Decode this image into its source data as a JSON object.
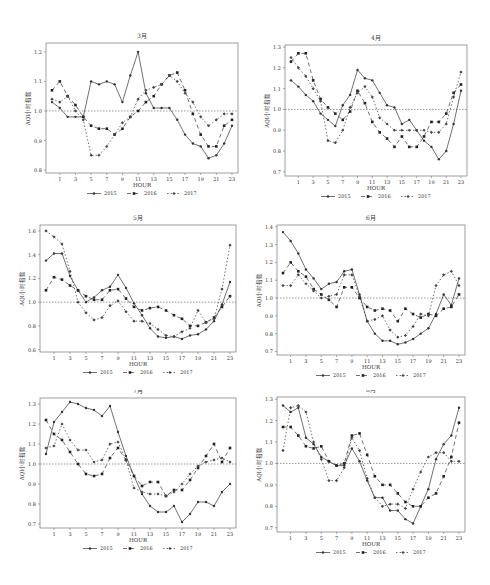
{
  "figure": {
    "note": "Series values are approximate visual estimates read from the plotted points, not printed data labels.",
    "legend": [
      "2015",
      "2016",
      "2017"
    ],
    "xlabel": "HOUR",
    "ylabel": "AQI小时指数",
    "reference_line": 1.0
  },
  "chart_data": [
    {
      "type": "line",
      "title": "3月",
      "xlabel": "HOUR",
      "ylabel": "AQI小时指数",
      "x": [
        0,
        1,
        2,
        3,
        4,
        5,
        6,
        7,
        8,
        9,
        10,
        11,
        12,
        13,
        14,
        15,
        16,
        17,
        18,
        19,
        20,
        21,
        22,
        23
      ],
      "xticks": [
        "1",
        "3",
        "5",
        "7",
        "9",
        "11",
        "13",
        "15",
        "17",
        "19",
        "21",
        "23"
      ],
      "yticks": [
        "0.8",
        "0.9",
        "1.0",
        "1.1",
        "1.2"
      ],
      "ylim": [
        0.79,
        1.23
      ],
      "series": [
        {
          "name": "2015",
          "values": [
            1.03,
            1.01,
            0.98,
            0.98,
            0.98,
            1.1,
            1.09,
            1.1,
            1.09,
            1.03,
            1.12,
            1.2,
            1.06,
            1.01,
            1.01,
            1.01,
            0.97,
            0.92,
            0.89,
            0.88,
            0.84,
            0.85,
            0.89,
            0.95
          ]
        },
        {
          "name": "2016",
          "values": [
            1.07,
            1.1,
            1.05,
            1.02,
            0.98,
            0.95,
            0.94,
            0.94,
            0.92,
            0.94,
            0.98,
            1.0,
            1.03,
            1.05,
            1.09,
            1.12,
            1.13,
            1.07,
            0.99,
            0.92,
            0.88,
            0.88,
            0.95,
            0.97
          ]
        },
        {
          "name": "2017",
          "values": [
            1.04,
            1.03,
            1.05,
            1.0,
            0.97,
            0.85,
            0.85,
            0.88,
            0.92,
            0.96,
            0.98,
            1.04,
            1.07,
            1.08,
            1.09,
            1.12,
            1.1,
            1.06,
            1.03,
            0.98,
            0.95,
            0.97,
            0.99,
            0.99
          ]
        }
      ]
    },
    {
      "type": "line",
      "title": "4月",
      "xlabel": "HOUR",
      "ylabel": "AQI小时指数",
      "x": [
        0,
        1,
        2,
        3,
        4,
        5,
        6,
        7,
        8,
        9,
        10,
        11,
        12,
        13,
        14,
        15,
        16,
        17,
        18,
        19,
        20,
        21,
        22,
        23
      ],
      "xticks": [
        "1",
        "3",
        "5",
        "7",
        "9",
        "11",
        "13",
        "15",
        "17",
        "19",
        "21",
        "23"
      ],
      "yticks": [
        "0.7",
        "0.8",
        "0.9",
        "1.0",
        "1.1",
        "1.2",
        "1.3"
      ],
      "ylim": [
        0.68,
        1.31
      ],
      "series": [
        {
          "name": "2015",
          "values": [
            1.14,
            1.11,
            1.07,
            1.04,
            0.98,
            0.95,
            0.92,
            1.02,
            1.07,
            1.19,
            1.15,
            1.14,
            1.08,
            1.02,
            1.01,
            0.93,
            0.95,
            0.9,
            0.85,
            0.82,
            0.76,
            0.8,
            0.93,
            1.09
          ]
        },
        {
          "name": "2016",
          "values": [
            1.23,
            1.27,
            1.27,
            1.14,
            1.05,
            1.01,
            0.98,
            0.95,
            0.99,
            1.09,
            1.03,
            0.94,
            0.89,
            0.86,
            0.82,
            0.87,
            0.82,
            0.82,
            0.87,
            0.94,
            0.94,
            0.98,
            1.08,
            1.12
          ]
        },
        {
          "name": "2017",
          "values": [
            1.25,
            1.2,
            1.16,
            1.1,
            1.04,
            0.85,
            0.84,
            0.9,
            1.01,
            1.08,
            1.11,
            1.06,
            0.96,
            0.93,
            0.9,
            0.9,
            0.9,
            0.9,
            0.9,
            0.89,
            0.89,
            0.93,
            1.06,
            1.18
          ]
        }
      ]
    },
    {
      "type": "line",
      "title": "5月",
      "xlabel": "HOUR",
      "ylabel": "AQI小时指数",
      "x": [
        0,
        1,
        2,
        3,
        4,
        5,
        6,
        7,
        8,
        9,
        10,
        11,
        12,
        13,
        14,
        15,
        16,
        17,
        18,
        19,
        20,
        21,
        22,
        23
      ],
      "xticks": [
        "1",
        "3",
        "5",
        "7",
        "9",
        "11",
        "13",
        "15",
        "17",
        "19",
        "21",
        "23"
      ],
      "yticks": [
        "0.6",
        "0.8",
        "1.0",
        "1.2",
        "1.4",
        "1.6"
      ],
      "ylim": [
        0.58,
        1.65
      ],
      "series": [
        {
          "name": "2015",
          "values": [
            1.35,
            1.41,
            1.41,
            1.22,
            1.1,
            1.0,
            1.04,
            1.1,
            1.13,
            1.23,
            1.12,
            0.99,
            0.89,
            0.78,
            0.71,
            0.7,
            0.71,
            0.69,
            0.72,
            0.73,
            0.77,
            0.84,
            0.98,
            1.17
          ]
        },
        {
          "name": "2016",
          "values": [
            1.1,
            1.21,
            1.19,
            1.14,
            1.1,
            1.05,
            1.02,
            1.02,
            1.1,
            1.11,
            1.03,
            0.96,
            0.93,
            0.95,
            0.96,
            0.93,
            0.89,
            0.86,
            0.8,
            0.8,
            0.83,
            0.87,
            0.96,
            1.05
          ]
        },
        {
          "name": "2017",
          "values": [
            1.6,
            1.55,
            1.49,
            1.26,
            1.0,
            0.91,
            0.85,
            0.87,
            0.97,
            1.01,
            0.92,
            0.84,
            0.84,
            0.82,
            0.77,
            0.72,
            0.71,
            0.75,
            0.78,
            0.93,
            0.83,
            0.86,
            1.11,
            1.48
          ]
        }
      ]
    },
    {
      "type": "line",
      "title": "6月",
      "xlabel": "HOUR",
      "ylabel": "AQI小时指数",
      "x": [
        0,
        1,
        2,
        3,
        4,
        5,
        6,
        7,
        8,
        9,
        10,
        11,
        12,
        13,
        14,
        15,
        16,
        17,
        18,
        19,
        20,
        21,
        22,
        23
      ],
      "xticks": [
        "1",
        "3",
        "5",
        "7",
        "9",
        "11",
        "13",
        "15",
        "17",
        "19",
        "21",
        "23"
      ],
      "yticks": [
        "0.7",
        "0.8",
        "0.9",
        "1.0",
        "1.1",
        "1.2",
        "1.3",
        "1.4"
      ],
      "ylim": [
        0.68,
        1.41
      ],
      "series": [
        {
          "name": "2015",
          "values": [
            1.37,
            1.32,
            1.25,
            1.16,
            1.11,
            1.05,
            1.08,
            1.09,
            1.15,
            1.16,
            1.02,
            0.87,
            0.8,
            0.76,
            0.76,
            0.74,
            0.75,
            0.77,
            0.8,
            0.83,
            0.91,
            1.02,
            0.96,
            1.11
          ]
        },
        {
          "name": "2016",
          "values": [
            1.14,
            1.2,
            1.15,
            1.12,
            1.05,
            1.02,
            0.99,
            0.95,
            1.06,
            1.06,
            1.0,
            0.95,
            0.93,
            0.94,
            0.93,
            0.87,
            0.94,
            0.91,
            0.89,
            0.91,
            0.9,
            0.94,
            0.95,
            1.02
          ]
        },
        {
          "name": "2017",
          "values": [
            1.07,
            1.07,
            1.13,
            1.08,
            1.04,
            1.0,
            1.01,
            1.02,
            1.13,
            1.13,
            1.01,
            0.87,
            0.88,
            0.9,
            0.82,
            0.78,
            0.79,
            0.84,
            0.91,
            0.9,
            1.07,
            1.13,
            1.15,
            1.07
          ]
        }
      ]
    },
    {
      "type": "line",
      "title": "7月",
      "xlabel": "HOUR",
      "ylabel": "AQI小时指数",
      "x": [
        0,
        1,
        2,
        3,
        4,
        5,
        6,
        7,
        8,
        9,
        10,
        11,
        12,
        13,
        14,
        15,
        16,
        17,
        18,
        19,
        20,
        21,
        22,
        23
      ],
      "xticks": [
        "1",
        "3",
        "5",
        "7",
        "9",
        "11",
        "13",
        "15",
        "17",
        "19",
        "21",
        "23"
      ],
      "yticks": [
        "0.7",
        "0.8",
        "0.9",
        "1.0",
        "1.1",
        "1.2",
        "1.3"
      ],
      "ylim": [
        0.68,
        1.33
      ],
      "series": [
        {
          "name": "2015",
          "values": [
            1.05,
            1.21,
            1.26,
            1.31,
            1.3,
            1.28,
            1.27,
            1.24,
            1.29,
            1.16,
            1.04,
            0.94,
            0.85,
            0.79,
            0.76,
            0.76,
            0.79,
            0.71,
            0.75,
            0.81,
            0.81,
            0.79,
            0.86,
            0.9
          ]
        },
        {
          "name": "2016",
          "values": [
            1.22,
            1.15,
            1.12,
            1.06,
            1.0,
            0.95,
            0.94,
            0.95,
            1.03,
            1.08,
            1.02,
            0.94,
            0.89,
            0.91,
            0.91,
            0.84,
            0.87,
            0.87,
            0.92,
            0.98,
            1.04,
            1.1,
            1.01,
            1.08
          ]
        },
        {
          "name": "2017",
          "values": [
            1.08,
            1.09,
            1.2,
            1.12,
            1.07,
            1.07,
            1.01,
            1.02,
            1.1,
            1.11,
            1.02,
            0.88,
            0.86,
            0.85,
            0.85,
            0.84,
            0.86,
            0.9,
            0.95,
            0.99,
            1.01,
            1.02,
            1.03,
            1.01
          ]
        }
      ]
    },
    {
      "type": "line",
      "title": "8月",
      "xlabel": "HOUR",
      "ylabel": "AQI小时指数",
      "x": [
        0,
        1,
        2,
        3,
        4,
        5,
        6,
        7,
        8,
        9,
        10,
        11,
        12,
        13,
        14,
        15,
        16,
        17,
        18,
        19,
        20,
        21,
        22,
        23
      ],
      "xticks": [
        "1",
        "3",
        "5",
        "7",
        "9",
        "11",
        "13",
        "15",
        "17",
        "19",
        "21",
        "23"
      ],
      "yticks": [
        "0.7",
        "0.8",
        "0.9",
        "1.0",
        "1.1",
        "1.2",
        "1.3"
      ],
      "ylim": [
        0.68,
        1.31
      ],
      "series": [
        {
          "name": "2015",
          "values": [
            1.27,
            1.24,
            1.26,
            1.12,
            1.09,
            1.03,
            1.01,
            0.99,
            0.99,
            1.07,
            1.01,
            0.92,
            0.84,
            0.84,
            0.78,
            0.78,
            0.74,
            0.72,
            0.8,
            0.88,
            1.02,
            1.09,
            1.13,
            1.26
          ]
        },
        {
          "name": "2016",
          "values": [
            1.17,
            1.17,
            1.13,
            1.08,
            1.07,
            1.08,
            1.01,
            0.99,
            1.0,
            1.13,
            1.14,
            1.04,
            0.94,
            0.9,
            0.9,
            0.86,
            0.82,
            0.8,
            0.8,
            0.84,
            0.86,
            0.94,
            1.03,
            1.19
          ]
        },
        {
          "name": "2017",
          "values": [
            1.06,
            1.26,
            1.27,
            1.24,
            1.1,
            1.02,
            0.92,
            0.92,
            0.98,
            1.12,
            1.06,
            0.93,
            0.84,
            0.8,
            0.81,
            0.81,
            0.79,
            0.88,
            0.96,
            1.03,
            1.05,
            1.05,
            1.01,
            1.01
          ]
        }
      ]
    }
  ]
}
